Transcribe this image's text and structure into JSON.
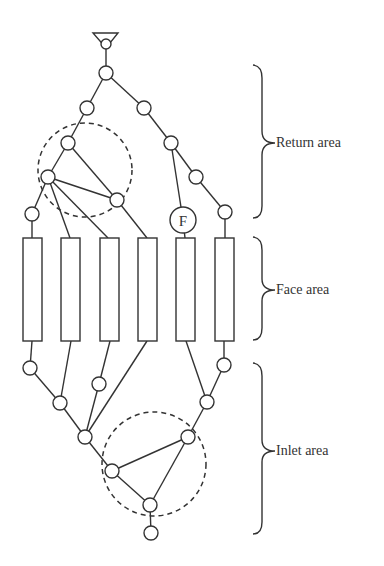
{
  "labels": {
    "return_area": "Return area",
    "face_area": "Face area",
    "inlet_area": "Inlet area",
    "fan_node": "F"
  },
  "colors": {
    "stroke": "#333333",
    "background": "#ffffff"
  },
  "diagram": {
    "source_symbol": "triangle-with-circle",
    "nodes_top": [
      [
        106,
        73
      ],
      [
        78,
        108
      ],
      [
        144,
        108
      ],
      [
        68,
        143
      ],
      [
        171,
        143
      ],
      [
        48,
        177
      ],
      [
        196,
        177
      ],
      [
        117,
        200
      ],
      [
        32,
        214
      ],
      [
        225,
        212
      ]
    ],
    "fan_node": [
      183,
      220
    ],
    "coil_rectangles": 6,
    "nodes_bottom": [
      [
        30,
        368
      ],
      [
        60,
        403
      ],
      [
        99,
        384
      ],
      [
        85,
        437
      ],
      [
        112,
        471
      ],
      [
        150,
        505
      ],
      [
        151,
        533
      ],
      [
        188,
        437
      ],
      [
        207,
        402
      ],
      [
        224,
        365
      ]
    ],
    "dashed_regions": 2
  }
}
